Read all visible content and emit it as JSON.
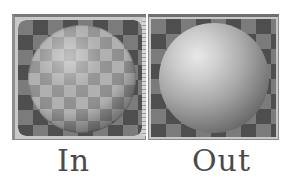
{
  "panels": [
    {
      "id": "in",
      "label": "In",
      "content": "material-sphere-checker-reflection"
    },
    {
      "id": "out",
      "label": "Out",
      "content": "material-sphere-smooth-shaded"
    }
  ],
  "colors": {
    "background": "#ffffff",
    "frame": "#c8c8c8",
    "checker_dark": "#4e4e4e",
    "checker_light": "#7b7b7b",
    "label_text": "#4a4a4a"
  }
}
